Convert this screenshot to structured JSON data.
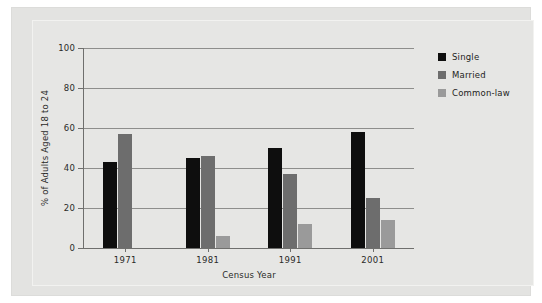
{
  "chart_data": {
    "type": "bar",
    "title": "",
    "xlabel": "Census Year",
    "ylabel": "% of Adults Aged 18 to 24",
    "categories": [
      "1971",
      "1981",
      "1991",
      "2001"
    ],
    "series": [
      {
        "name": "Single",
        "color": "#0e0e0e",
        "values": [
          43,
          45,
          50,
          58
        ]
      },
      {
        "name": "Married",
        "color": "#6d6d6d",
        "values": [
          57,
          46,
          37,
          25
        ]
      },
      {
        "name": "Common-law",
        "color": "#9a9a9a",
        "values": [
          0,
          6,
          12,
          14
        ]
      }
    ],
    "ylim": [
      0,
      100
    ],
    "yticks": [
      0,
      20,
      40,
      60,
      80,
      100
    ],
    "ytick_labels": [
      "0",
      "20",
      "40",
      "60",
      "80",
      "100"
    ],
    "grid": true,
    "legend_position": "top-right"
  },
  "legend": {
    "items": [
      {
        "label": "Single"
      },
      {
        "label": "Married"
      },
      {
        "label": "Common-law"
      }
    ]
  },
  "axes": {
    "y_title": "% of Adults Aged 18 to 24",
    "x_title": "Census Year",
    "y_ticks": [
      "100",
      "80",
      "60",
      "40",
      "20",
      "0"
    ],
    "x_ticks": [
      "1971",
      "1981",
      "1991",
      "2001"
    ]
  },
  "colors": {
    "single": "#0e0e0e",
    "married": "#6d6d6d",
    "common_law": "#9a9a9a",
    "background": "#e3e3e1",
    "grid": "#8e8e8c"
  }
}
